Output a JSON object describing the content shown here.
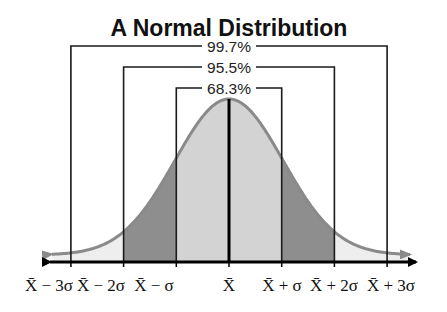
{
  "chart_data": {
    "type": "area",
    "title": "A Normal Distribution",
    "xlabel": "",
    "ylabel": "",
    "distribution": {
      "mean_label": "X̄",
      "sd_symbol": "σ"
    },
    "categories": [
      "X̄ − 3σ",
      "X̄ − 2σ",
      "X̄ − σ",
      "X̄",
      "X̄ + σ",
      "X̄ + 2σ",
      "X̄ + 3σ"
    ],
    "z_positions": [
      -3,
      -2,
      -1,
      0,
      1,
      2,
      3
    ],
    "brackets": [
      {
        "label": "99.7%",
        "from_z": -3,
        "to_z": 3
      },
      {
        "label": "95.5%",
        "from_z": -2,
        "to_z": 2
      },
      {
        "label": "68.3%",
        "from_z": -1,
        "to_z": 1
      }
    ],
    "regions": [
      {
        "name": "within 1 sd",
        "from_z": -1,
        "to_z": 1,
        "color": "#d3d3d3"
      },
      {
        "name": "between 1 and 2 sd",
        "from_z": -2,
        "to_z": -1,
        "color": "#8e8e8e"
      },
      {
        "name": "between 1 and 2 sd",
        "from_z": 1,
        "to_z": 2,
        "color": "#8e8e8e"
      },
      {
        "name": "tail",
        "from_z": -3.4,
        "to_z": -2,
        "color": "#eeeeee"
      },
      {
        "name": "tail",
        "from_z": 2,
        "to_z": 3.4,
        "color": "#eeeeee"
      }
    ],
    "colors": {
      "curve": "#8a8a8a",
      "lines": "#1a1a1a",
      "axis": "#000000"
    },
    "grid": false,
    "legend": null
  },
  "labels": {
    "title": "A Normal Distribution",
    "pct_outer": "99.7%",
    "pct_middle": "95.5%",
    "pct_inner": "68.3%"
  }
}
